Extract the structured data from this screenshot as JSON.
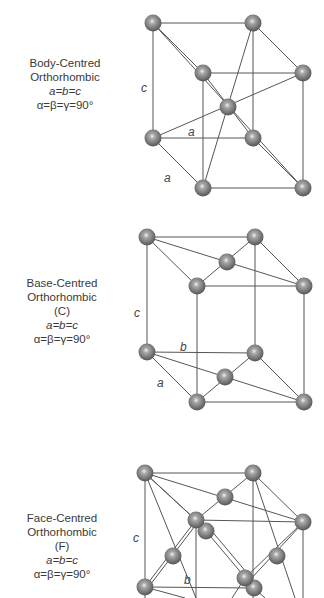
{
  "colors": {
    "background": "#ffffff",
    "edge": "#555555",
    "atom": "#777777",
    "atom_highlight": "#e8e8e8",
    "text": "#3a3a3a"
  },
  "lattices": [
    {
      "name": "Body-Centred",
      "line2": "Orthorhombic",
      "symbol": "",
      "relation_lengths": "a=b=c",
      "relation_angles": "α=β=γ=90°",
      "axis_labels": {
        "c": "c",
        "a1": "a",
        "a2": "a"
      }
    },
    {
      "name": "Base-Centred",
      "line2": "Orthorhombic",
      "symbol": "(C)",
      "relation_lengths": "a=b=c",
      "relation_angles": "α=β=γ=90°",
      "axis_labels": {
        "c": "c",
        "b": "b",
        "a": "a"
      }
    },
    {
      "name": "Face-Centred",
      "line2": "Orthorhombic",
      "symbol": "(F)",
      "relation_lengths": "a=b=c",
      "relation_angles": "α=β=γ=90°",
      "axis_labels": {
        "c": "c",
        "b": "b"
      }
    }
  ]
}
